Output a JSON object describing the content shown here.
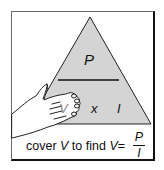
{
  "diagram": {
    "triangle": {
      "top_label": "P",
      "bottom_left_label": "V",
      "operator": "x",
      "bottom_right_label": "I",
      "fill_color": "#d4d4d4",
      "stroke_color": "#222222"
    },
    "caption": {
      "prefix": "cover ",
      "covered_var": "V",
      "middle": " to find ",
      "result_var": "V",
      "equals": "=",
      "numerator": "P",
      "denominator": "I"
    },
    "icons": {
      "hand": "hand-covering-icon"
    }
  }
}
